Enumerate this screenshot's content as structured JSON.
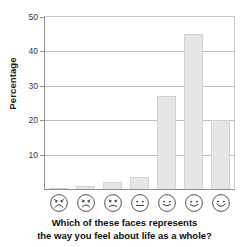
{
  "chart_data": {
    "type": "bar",
    "title": "",
    "subtitle": "",
    "xlabel": "Which of these faces represents the way you feel about life as a whole?",
    "ylabel": "Percentage",
    "categories": [
      "very unhappy face",
      "unhappy face",
      "slightly unhappy face",
      "neutral face",
      "slightly happy face",
      "happy face",
      "very happy face"
    ],
    "category_labels": [
      "",
      "",
      "",
      "",
      "",
      "",
      ""
    ],
    "values": [
      0.3,
      1,
      2,
      3.5,
      27,
      45,
      20
    ],
    "ylim": [
      0,
      50
    ],
    "yticks": [
      10,
      20,
      30,
      40,
      50
    ],
    "ytick_labels": [
      "10",
      "20",
      "30",
      "40",
      "50"
    ],
    "grid": true,
    "grid_axis": "y",
    "legend": false,
    "bar_color": "#e6e6e6",
    "bar_edge_color": "#d2d2d2",
    "axis_color": "#8e8e8e",
    "grid_color": "#bdbdbd"
  },
  "axes": {
    "y_label": "Percentage",
    "y_ticks": [
      {
        "value": 50,
        "label": "50"
      },
      {
        "value": 40,
        "label": "40"
      },
      {
        "value": 30,
        "label": "30"
      },
      {
        "value": 20,
        "label": "20"
      },
      {
        "value": 10,
        "label": "10"
      }
    ]
  },
  "faces": [
    {
      "name": "face-very-unhappy",
      "mood": "very-unhappy"
    },
    {
      "name": "face-unhappy",
      "mood": "unhappy"
    },
    {
      "name": "face-slightly-unhappy",
      "mood": "slightly-unhappy"
    },
    {
      "name": "face-neutral",
      "mood": "neutral"
    },
    {
      "name": "face-slightly-happy",
      "mood": "slightly-happy"
    },
    {
      "name": "face-happy",
      "mood": "happy"
    },
    {
      "name": "face-very-happy",
      "mood": "very-happy"
    }
  ],
  "caption": {
    "line1": "Which of these faces represents",
    "line2": "the way you feel about life as a whole?"
  }
}
